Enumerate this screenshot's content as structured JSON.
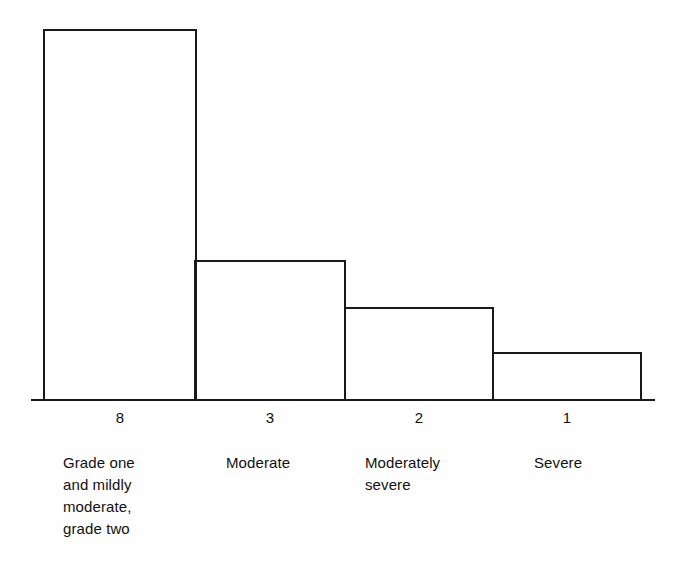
{
  "chart_data": {
    "type": "bar",
    "title": "",
    "subtitle": "",
    "xlabel": "",
    "ylabel": "",
    "grid": false,
    "legend": false,
    "axis": {
      "baseline_visible": true,
      "y_axis_visible": false,
      "ticks": "bar-edges"
    },
    "categories": [
      "Grade one\nand mildly\nmoderate,\ngrade two",
      "Moderate",
      "Moderately\nsevere",
      "Severe"
    ],
    "values": [
      8,
      3,
      2,
      1
    ],
    "value_labels": [
      "8",
      "3",
      "2",
      "1"
    ],
    "ylim": [
      0,
      8
    ],
    "bar_style": {
      "fill": "none",
      "stroke": "#1a1a1a",
      "stroke_width": 2.5
    },
    "colors": {
      "stroke": "#1a1a1a",
      "background": "#fefefe",
      "text": "#111111"
    },
    "geometry": {
      "baseline_y": 400,
      "axis_x_start": 31,
      "axis_x_end": 655,
      "bars": [
        {
          "x": 44,
          "width": 152,
          "top": 30
        },
        {
          "x": 195,
          "width": 150,
          "top": 261
        },
        {
          "x": 345,
          "width": 148,
          "top": 308
        },
        {
          "x": 493,
          "width": 148,
          "top": 353
        }
      ]
    },
    "value_label_positions": [
      {
        "left": 44,
        "width": 152
      },
      {
        "left": 195,
        "width": 150
      },
      {
        "left": 345,
        "width": 148
      },
      {
        "left": 493,
        "width": 148
      }
    ],
    "category_label_positions": [
      {
        "left": 63
      },
      {
        "left": 226
      },
      {
        "left": 365
      },
      {
        "left": 534
      }
    ]
  }
}
